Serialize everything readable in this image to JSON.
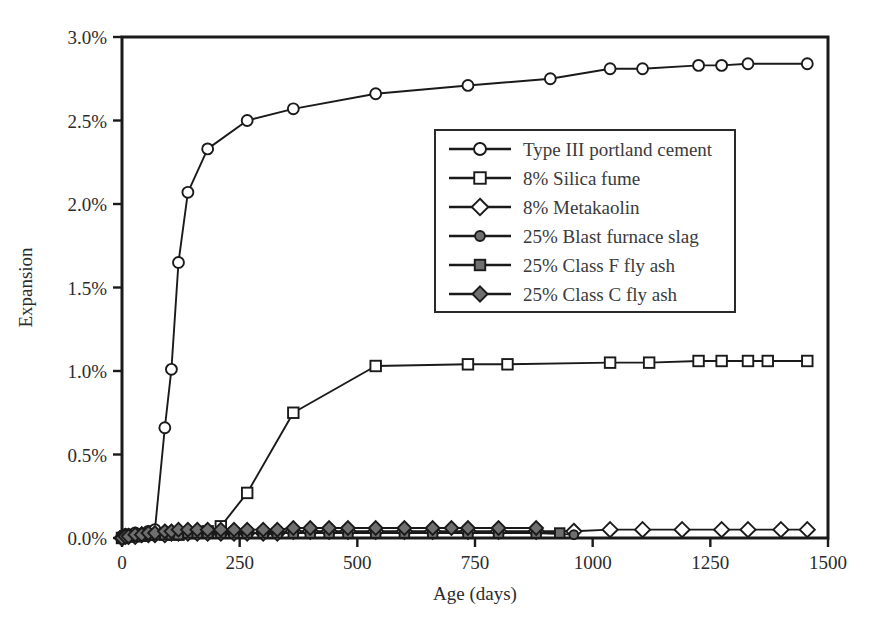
{
  "chart_data": {
    "type": "line",
    "title": "",
    "xlabel": "Age (days)",
    "ylabel": "Expansion",
    "xlim": [
      0,
      1500
    ],
    "ylim": [
      0,
      3.0
    ],
    "grid": false,
    "legend_position": "center-right-upper",
    "x_ticks": [
      0,
      250,
      500,
      750,
      1000,
      1250,
      1500
    ],
    "x_tick_labels": [
      "0",
      "250",
      "500",
      "750",
      "1000",
      "1250",
      "1500"
    ],
    "y_ticks": [
      0,
      0.5,
      1.0,
      1.5,
      2.0,
      2.5,
      3.0
    ],
    "y_tick_labels": [
      "0.0%",
      "0.5%",
      "1.0%",
      "1.5%",
      "2.0%",
      "2.5%",
      "3.0%"
    ],
    "y_unit": "percent",
    "series": [
      {
        "name": "Type III portland cement",
        "marker": "circle-open",
        "x": [
          0,
          7,
          14,
          28,
          56,
          70,
          91,
          105,
          120,
          140,
          182,
          266,
          364,
          539,
          735,
          910,
          1037,
          1106,
          1225,
          1274,
          1330,
          1456
        ],
        "y": [
          0.01,
          0.02,
          0.02,
          0.03,
          0.04,
          0.05,
          0.66,
          1.01,
          1.65,
          2.07,
          2.33,
          2.5,
          2.57,
          2.66,
          2.71,
          2.75,
          2.81,
          2.81,
          2.83,
          2.83,
          2.84,
          2.84
        ]
      },
      {
        "name": "8% Silica fume",
        "marker": "square-open",
        "x": [
          0,
          7,
          14,
          28,
          56,
          91,
          120,
          150,
          182,
          210,
          266,
          364,
          539,
          735,
          819,
          1037,
          1120,
          1225,
          1274,
          1330,
          1372,
          1456
        ],
        "y": [
          0.0,
          0.01,
          0.01,
          0.01,
          0.02,
          0.02,
          0.02,
          0.03,
          0.04,
          0.07,
          0.27,
          0.75,
          1.03,
          1.04,
          1.04,
          1.05,
          1.05,
          1.06,
          1.06,
          1.06,
          1.06,
          1.06
        ]
      },
      {
        "name": "8% Metakaolin",
        "marker": "diamond-open",
        "x": [
          0,
          7,
          14,
          28,
          42,
          56,
          70,
          91,
          105,
          120,
          140,
          160,
          182,
          210,
          238,
          266,
          300,
          330,
          364,
          400,
          440,
          480,
          539,
          600,
          660,
          735,
          800,
          880,
          960,
          1037,
          1106,
          1190,
          1274,
          1330,
          1400,
          1456
        ],
        "y": [
          0.0,
          0.01,
          0.01,
          0.01,
          0.02,
          0.02,
          0.02,
          0.02,
          0.03,
          0.03,
          0.03,
          0.03,
          0.03,
          0.03,
          0.03,
          0.03,
          0.03,
          0.03,
          0.04,
          0.04,
          0.04,
          0.04,
          0.04,
          0.04,
          0.04,
          0.04,
          0.04,
          0.04,
          0.04,
          0.05,
          0.05,
          0.05,
          0.05,
          0.05,
          0.05,
          0.05
        ]
      },
      {
        "name": "25% Blast furnace slag",
        "marker": "circle-fill",
        "x": [
          0,
          7,
          14,
          28,
          42,
          56,
          70,
          91,
          105,
          120,
          140,
          160,
          182,
          210,
          238,
          266,
          300,
          330,
          364,
          400,
          440,
          480,
          539,
          600,
          660,
          735,
          800,
          880,
          960
        ],
        "y": [
          0.0,
          0.01,
          0.01,
          0.01,
          0.02,
          0.02,
          0.02,
          0.02,
          0.02,
          0.03,
          0.03,
          0.03,
          0.03,
          0.03,
          0.03,
          0.03,
          0.03,
          0.03,
          0.03,
          0.03,
          0.03,
          0.03,
          0.03,
          0.03,
          0.03,
          0.03,
          0.03,
          0.03,
          0.02
        ]
      },
      {
        "name": "25% Class F fly ash",
        "marker": "square-fill",
        "x": [
          0,
          7,
          14,
          28,
          42,
          56,
          70,
          91,
          105,
          120,
          140,
          160,
          182,
          210,
          238,
          266,
          300,
          330,
          364,
          400,
          440,
          480,
          539,
          600,
          660,
          735,
          800,
          880,
          930
        ],
        "y": [
          0.0,
          0.01,
          0.01,
          0.01,
          0.01,
          0.02,
          0.02,
          0.02,
          0.02,
          0.02,
          0.03,
          0.03,
          0.03,
          0.03,
          0.03,
          0.03,
          0.03,
          0.03,
          0.03,
          0.03,
          0.03,
          0.03,
          0.03,
          0.03,
          0.03,
          0.03,
          0.03,
          0.03,
          0.03
        ]
      },
      {
        "name": "25% Class C fly ash",
        "marker": "diamond-fill",
        "x": [
          0,
          7,
          14,
          28,
          42,
          56,
          70,
          91,
          105,
          120,
          140,
          160,
          182,
          210,
          238,
          266,
          300,
          330,
          364,
          400,
          440,
          480,
          539,
          600,
          660,
          700,
          735,
          800,
          880
        ],
        "y": [
          0.0,
          0.01,
          0.01,
          0.02,
          0.02,
          0.03,
          0.03,
          0.04,
          0.04,
          0.05,
          0.05,
          0.05,
          0.05,
          0.05,
          0.05,
          0.05,
          0.05,
          0.05,
          0.06,
          0.06,
          0.06,
          0.06,
          0.06,
          0.06,
          0.06,
          0.06,
          0.06,
          0.06,
          0.06
        ]
      }
    ]
  },
  "legend": {
    "entries": [
      "Type III portland cement",
      "8% Silica fume",
      "8% Metakaolin",
      "25% Blast furnace slag",
      "25% Class F fly ash",
      "25% Class C fly ash"
    ]
  },
  "colors": {
    "line": "#1a1a1a",
    "marker_fill": "#6f6f6f",
    "marker_open": "#ffffff",
    "text": "#2b2b2b",
    "background": "#ffffff"
  }
}
